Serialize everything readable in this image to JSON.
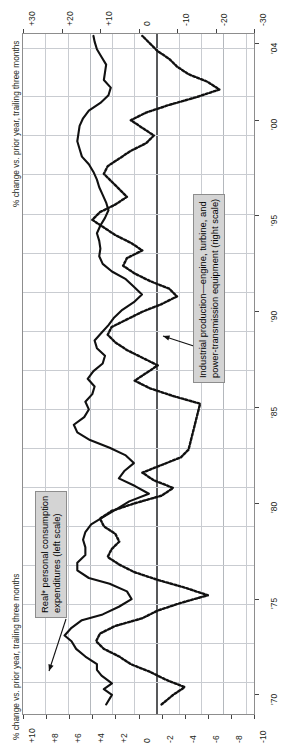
{
  "chart_data": {
    "type": "line",
    "title": "",
    "orientation": "vertical-time-axis (chart rotated 90 degrees; time runs bottom-to-top)",
    "xlabel_top": "% change vs. prior year, trailing three months",
    "xlabel_bottom": "% change vs. prior year, trailing three months",
    "grid": true,
    "legend_position": "inline-callouts",
    "axes": {
      "time_axis": {
        "name": "year",
        "tick_labels": [
          "'70",
          "'75",
          "'80",
          "'85",
          "'90",
          "'95",
          "'00",
          "'04"
        ],
        "tick_values": [
          1970,
          1975,
          1980,
          1985,
          1990,
          1995,
          2000,
          2004
        ],
        "range": [
          1969,
          2004.5
        ]
      },
      "left_scale": {
        "name": "Real personal consumption expenditures (left scale)",
        "tick_labels": [
          "+10",
          "+8",
          "+6",
          "+4",
          "+2",
          "0",
          "-2",
          "-4",
          "-6",
          "-8",
          "-10"
        ],
        "tick_values": [
          10,
          8,
          6,
          4,
          2,
          0,
          -2,
          -4,
          -6,
          -8,
          -10
        ],
        "range": [
          10,
          -10
        ]
      },
      "right_scale": {
        "name": "Industrial production-engine, turbine, and power-transmission equipment (right scale)",
        "tick_labels": [
          "+30",
          "+20",
          "+10",
          "0",
          "-10",
          "-20",
          "-30"
        ],
        "tick_values": [
          30,
          20,
          10,
          0,
          -10,
          -20,
          -30
        ],
        "range": [
          30,
          -30
        ]
      }
    },
    "series": [
      {
        "name": "Real* personal consumption expenditures (left scale)",
        "style": "solid",
        "color": "#111111",
        "scale": "left",
        "x": [
          1969.5,
          1970.0,
          1970.3,
          1970.6,
          1971.0,
          1971.3,
          1971.6,
          1972.0,
          1972.4,
          1972.8,
          1973.1,
          1973.5,
          1973.9,
          1974.2,
          1974.6,
          1975.0,
          1975.4,
          1975.8,
          1976.1,
          1976.5,
          1976.9,
          1977.3,
          1977.7,
          1978.1,
          1978.5,
          1978.9,
          1979.3,
          1979.7,
          1980.1,
          1980.5,
          1980.9,
          1981.3,
          1981.7,
          1982.1,
          1982.5,
          1982.9,
          1983.3,
          1983.7,
          1984.1,
          1984.5,
          1984.9,
          1985.3,
          1985.7,
          1986.1,
          1986.5,
          1986.9,
          1987.3,
          1987.7,
          1988.1,
          1988.5,
          1988.9,
          1989.3,
          1989.7,
          1990.1,
          1990.5,
          1990.9,
          1991.3,
          1991.7,
          1992.1,
          1992.5,
          1992.9,
          1993.3,
          1993.7,
          1994.1,
          1994.5,
          1994.9,
          1995.3,
          1995.7,
          1996.1,
          1996.5,
          1996.9,
          1997.3,
          1997.7,
          1998.1,
          1998.5,
          1998.9,
          1999.3,
          1999.7,
          2000.1,
          2000.5,
          2000.9,
          2001.3,
          2001.7,
          2002.1,
          2002.5,
          2002.9,
          2003.3,
          2003.7,
          2004.1,
          2004.4
        ],
        "values": [
          2.8,
          2.3,
          3.0,
          2.3,
          3.2,
          3.6,
          3.6,
          4.6,
          5.4,
          5.8,
          6.4,
          5.8,
          4.9,
          3.1,
          1.7,
          0.6,
          1.0,
          2.5,
          4.3,
          5.3,
          5.3,
          4.6,
          4.6,
          4.8,
          4.6,
          4.1,
          3.0,
          1.9,
          0.8,
          -0.9,
          0.3,
          1.7,
          1.2,
          0.4,
          1.1,
          2.5,
          4.2,
          5.3,
          5.6,
          4.7,
          4.3,
          4.6,
          4.0,
          3.8,
          4.4,
          3.9,
          3.1,
          2.9,
          3.6,
          3.8,
          3.2,
          2.6,
          2.1,
          1.4,
          0.4,
          -0.3,
          0.4,
          1.1,
          2.3,
          3.1,
          3.4,
          3.3,
          3.4,
          3.6,
          3.3,
          2.9,
          2.6,
          2.8,
          3.1,
          3.4,
          3.6,
          3.9,
          4.3,
          4.9,
          5.1,
          5.3,
          5.2,
          5.1,
          4.8,
          4.3,
          3.3,
          2.6,
          2.4,
          3.0,
          2.9,
          2.8,
          3.2,
          3.6,
          3.8,
          3.9
        ]
      },
      {
        "name": "Industrial production-engine, turbine, and power-transmission equipment (right scale)",
        "style": "dotted",
        "color": "#111111",
        "scale": "right",
        "note": "series has a data break/flat segment circa 1982-1983",
        "x": [
          1969.5,
          1970.0,
          1970.4,
          1970.8,
          1971.2,
          1971.6,
          1972.0,
          1972.4,
          1972.8,
          1973.2,
          1973.6,
          1974.0,
          1974.4,
          1974.8,
          1975.2,
          1975.6,
          1976.0,
          1976.4,
          1976.8,
          1977.2,
          1977.6,
          1978.0,
          1978.4,
          1978.8,
          1979.2,
          1979.6,
          1980.0,
          1980.4,
          1980.8,
          1981.2,
          1981.6,
          1982.0,
          1982.4,
          1982.8,
          1983.2,
          1983.6,
          1984.0,
          1984.4,
          1984.8,
          1985.2,
          1985.6,
          1986.0,
          1986.4,
          1986.8,
          1987.2,
          1987.6,
          1988.0,
          1988.4,
          1988.8,
          1989.2,
          1989.6,
          1990.0,
          1990.4,
          1990.8,
          1991.2,
          1991.6,
          1992.0,
          1992.4,
          1992.8,
          1993.2,
          1993.6,
          1994.0,
          1994.4,
          1994.8,
          1995.2,
          1995.6,
          1996.0,
          1996.4,
          1996.8,
          1997.2,
          1997.6,
          1998.0,
          1998.4,
          1998.8,
          1999.2,
          1999.6,
          2000.0,
          2000.4,
          2000.8,
          2001.2,
          2001.6,
          2002.0,
          2002.4,
          2002.8,
          2003.2,
          2003.6,
          2004.0,
          2004.4
        ],
        "values": [
          -6.0,
          -9.0,
          -12.0,
          -7.0,
          -3.0,
          2.0,
          5.0,
          9.0,
          11.0,
          10.0,
          6.0,
          -1.0,
          -5.0,
          -11.0,
          -18.0,
          -12.0,
          -5.0,
          1.0,
          5.0,
          8.0,
          7.0,
          5.0,
          6.0,
          9.0,
          10.0,
          7.0,
          1.0,
          -6.0,
          -9.0,
          -4.0,
          -1.0,
          -6.0,
          -11.0,
          -13.0,
          -13.5,
          -14.0,
          -14.5,
          -15.0,
          -15.5,
          -16.0,
          -9.0,
          -3.0,
          1.0,
          -2.0,
          -5.0,
          -1.0,
          3.0,
          6.0,
          8.0,
          7.0,
          3.0,
          -1.0,
          -6.0,
          -10.0,
          -8.0,
          -3.0,
          1.0,
          4.0,
          3.0,
          -1.0,
          2.0,
          6.0,
          9.0,
          12.0,
          10.0,
          6.0,
          3.0,
          5.0,
          7.0,
          9.0,
          8.0,
          5.0,
          2.0,
          -2.0,
          -4.0,
          -1.0,
          2.0,
          -2.0,
          -8.0,
          -15.0,
          -21.0,
          -18.0,
          -13.0,
          -10.0,
          -8.0,
          -5.0,
          -3.0,
          -1.0
        ]
      }
    ]
  },
  "axis_labels": {
    "top_title": "% change vs. prior year, trailing three months",
    "bottom_title": "% change vs. prior year, trailing three months",
    "top_ticks": [
      "+30",
      "+20",
      "+10",
      "0",
      "-10",
      "-20",
      "-30"
    ],
    "bottom_ticks": [
      "+10",
      "+8",
      "+6",
      "+4",
      "+2",
      "0",
      "-2",
      "-4",
      "-6",
      "-8",
      "-10"
    ],
    "year_ticks": [
      "'04",
      "'00",
      "'95",
      "'90",
      "'85",
      "'80",
      "'75",
      "'70"
    ]
  },
  "legends": {
    "left_series": {
      "line1": "Real* personal consumption",
      "line2": "expenditures (left scale)"
    },
    "right_series": {
      "line1": "Industrial production—engine, turbine, and",
      "line2": "power-transmission equipment (right scale)"
    }
  },
  "colors": {
    "ink": "#111111",
    "grid": "#c9ccd1",
    "frame": "#8d8d8d",
    "zero": "#58595b",
    "legend_bg": "#d4d4d4"
  }
}
